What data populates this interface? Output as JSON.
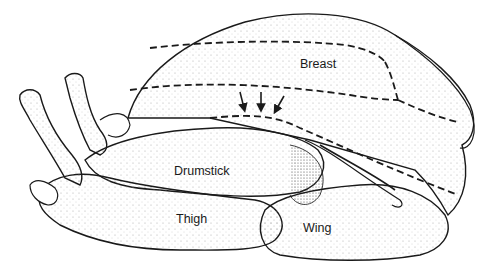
{
  "figure": {
    "labels": [
      {
        "id": "breast",
        "text": "Breast",
        "x": 300,
        "y": 58
      },
      {
        "id": "drumstick",
        "text": "Drumstick",
        "x": 174,
        "y": 165
      },
      {
        "id": "thigh",
        "text": "Thigh",
        "x": 176,
        "y": 213
      },
      {
        "id": "wing",
        "text": "Wing",
        "x": 303,
        "y": 222
      }
    ],
    "arrows_count": 3,
    "colors": {
      "ink": "#1a1a1a",
      "background": "#ffffff",
      "stipple": "#8a8a8a"
    }
  }
}
